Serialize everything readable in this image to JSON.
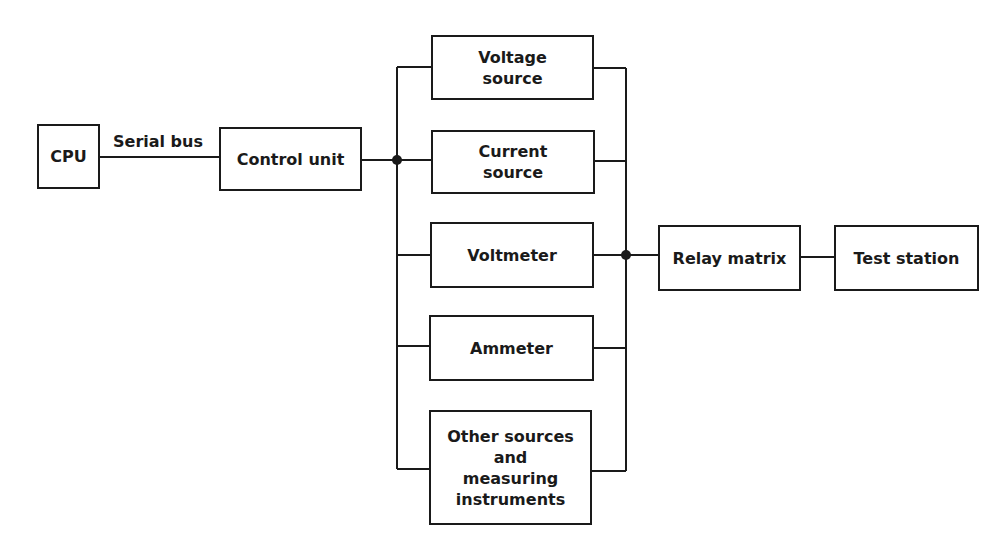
{
  "diagram": {
    "blocks": {
      "cpu": "CPU",
      "control_unit": "Control unit",
      "voltage_source": "Voltage\nsource",
      "current_source": "Current\nsource",
      "voltmeter": "Voltmeter",
      "ammeter": "Ammeter",
      "other": "Other sources\nand\nmeasuring\ninstruments",
      "relay_matrix": "Relay matrix",
      "test_station": "Test station"
    },
    "labels": {
      "serial_bus": "Serial bus"
    },
    "colors": {
      "line": "#1a1a1a",
      "background": "#ffffff"
    }
  }
}
